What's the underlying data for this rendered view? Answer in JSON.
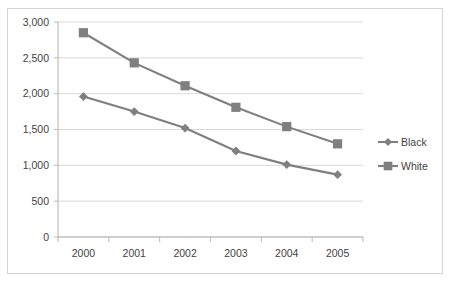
{
  "chart_data": {
    "type": "line",
    "title": "",
    "subtitle": "",
    "xlabel": "",
    "ylabel": "",
    "categories": [
      "2000",
      "2001",
      "2002",
      "2003",
      "2004",
      "2005"
    ],
    "series": [
      {
        "name": "Black",
        "marker": "diamond",
        "color": "#7f7f7f",
        "values": [
          1960,
          1750,
          1520,
          1200,
          1010,
          870
        ]
      },
      {
        "name": "White",
        "marker": "square",
        "color": "#7f7f7f",
        "values": [
          2850,
          2430,
          2110,
          1810,
          1540,
          1300
        ]
      }
    ],
    "ylim": [
      0,
      3000
    ],
    "ytick_values": [
      0,
      500,
      1000,
      1500,
      2000,
      2500,
      3000
    ],
    "ytick_labels": [
      "0",
      "500",
      "1,000",
      "1,500",
      "2,000",
      "2,500",
      "3,000"
    ],
    "grid": true,
    "legend_position": "right",
    "legend_entries": [
      "Black",
      "White"
    ]
  },
  "colors": {
    "series": "#7f7f7f",
    "gridline": "#d9d9d9",
    "axis": "#b0b0b0",
    "text": "#3f3f3f",
    "frame_border": "#d4d4d4",
    "background": "#ffffff"
  },
  "top_fragment": {
    "text": ""
  }
}
